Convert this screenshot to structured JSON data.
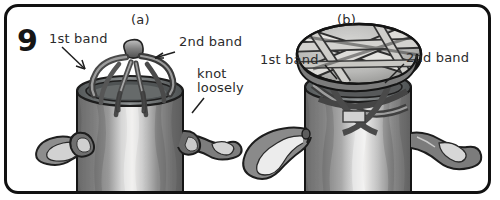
{
  "figure": {
    "step_number": "9",
    "style": "hand-drawn grayscale instructional diagram",
    "border_color": "#111111",
    "background_color": "#ffffff",
    "text_color": "#2b2b2b"
  },
  "panels": [
    {
      "id": "a",
      "label": "(a)",
      "annotations": [
        {
          "name": "first-band",
          "text": "1st band"
        },
        {
          "name": "second-band",
          "text": "2nd band"
        },
        {
          "name": "knot-loosely",
          "text": "knot\nloosely"
        }
      ]
    },
    {
      "id": "b",
      "label": "(b)",
      "annotations": [
        {
          "name": "first-band",
          "text": "1st band"
        },
        {
          "name": "second-band",
          "text": "2nd band"
        }
      ]
    }
  ],
  "colors": {
    "ink": "#1a1a1a",
    "can_dark": "#6e6e6e",
    "can_mid": "#8d8d8d",
    "can_light": "#d8d8d8",
    "can_highlight": "#eceaea",
    "band_dark": "#4a4a4a",
    "band_mid": "#7a7a7a",
    "band_light": "#c9c9c9",
    "lid_fill": "#bfbfbf",
    "lid_band": "#dededc"
  }
}
